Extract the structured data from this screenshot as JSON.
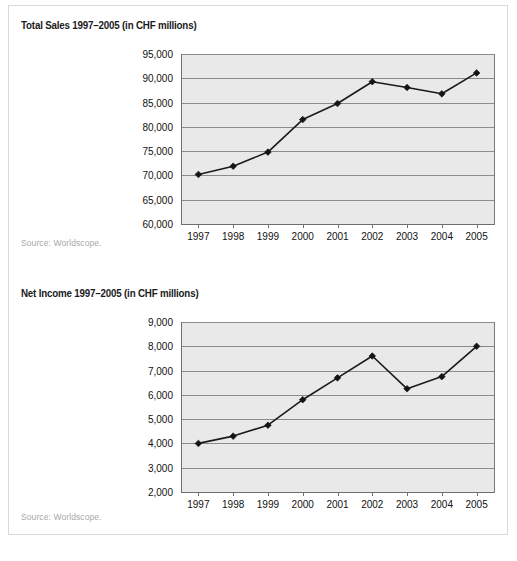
{
  "page": {
    "background_color": "#ffffff",
    "frame_border_color": "#d8d8d8"
  },
  "figures": [
    {
      "id": "total-sales",
      "title": "Total Sales 1997–2005 (in CHF millions)",
      "source": "Source: Worldscope."
    },
    {
      "id": "net-income",
      "title": "Net Income 1997–2005 (in CHF millions)",
      "source": "Source: Worldscope."
    }
  ],
  "chart_data": [
    {
      "type": "line",
      "id": "total-sales",
      "title": "Total Sales 1997–2005 (in CHF millions)",
      "subtitle": "",
      "xlabel": "",
      "ylabel": "",
      "categories": [
        "1997",
        "1998",
        "1999",
        "2000",
        "2001",
        "2002",
        "2003",
        "2004",
        "2005"
      ],
      "values": [
        70200,
        71900,
        74800,
        81500,
        84800,
        89300,
        88100,
        86800,
        91100
      ],
      "ylim": [
        60000,
        95000
      ],
      "ytick_step": 5000,
      "ytick_labels": [
        "60,000",
        "65,000",
        "70,000",
        "75,000",
        "80,000",
        "85,000",
        "90,000",
        "95,000"
      ],
      "ytick_values": [
        60000,
        65000,
        70000,
        75000,
        80000,
        85000,
        90000,
        95000
      ],
      "grid": true,
      "legend": "none",
      "marker": "diamond",
      "line_color": "#1b1b1b",
      "plot_background": "#e9e9e9",
      "gridline_color": "#8a8a8a",
      "source": "Source: Worldscope."
    },
    {
      "type": "line",
      "id": "net-income",
      "title": "Net Income 1997–2005 (in CHF millions)",
      "subtitle": "",
      "xlabel": "",
      "ylabel": "",
      "categories": [
        "1997",
        "1998",
        "1999",
        "2000",
        "2001",
        "2002",
        "2003",
        "2004",
        "2005"
      ],
      "values": [
        4000,
        4300,
        4750,
        5800,
        6700,
        7600,
        6250,
        6750,
        8000
      ],
      "ylim": [
        2000,
        9000
      ],
      "ytick_step": 1000,
      "ytick_labels": [
        "2,000",
        "3,000",
        "4,000",
        "5,000",
        "6,000",
        "7,000",
        "8,000",
        "9,000"
      ],
      "ytick_values": [
        2000,
        3000,
        4000,
        5000,
        6000,
        7000,
        8000,
        9000
      ],
      "grid": true,
      "legend": "none",
      "marker": "diamond",
      "line_color": "#1b1b1b",
      "plot_background": "#e9e9e9",
      "gridline_color": "#8a8a8a",
      "source": "Source: Worldscope."
    }
  ]
}
